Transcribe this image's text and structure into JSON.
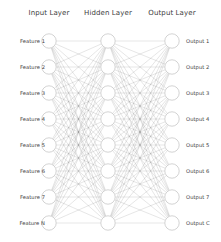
{
  "diagram": {
    "title_semantic": "neural-network-architecture-diagram",
    "background_color": "#ffffff",
    "node_fill_color": "#ffffff",
    "node_stroke_color": "#c8c8c8",
    "edge_color": "#5a5a5a",
    "text_color": "#3c3c3c",
    "layers": [
      {
        "id": "input",
        "title": "Input Layer",
        "center_x": 49,
        "node_count": 8,
        "label_side": "left",
        "nodes": [
          {
            "label": "Feature 1",
            "cy": 41
          },
          {
            "label": "Feature 2",
            "cy": 67
          },
          {
            "label": "Feature 3",
            "cy": 93
          },
          {
            "label": "Feature 4",
            "cy": 119
          },
          {
            "label": "Feature 5",
            "cy": 145
          },
          {
            "label": "Feature 6",
            "cy": 171
          },
          {
            "label": "Feature 7",
            "cy": 197
          },
          {
            "label": "Feature N",
            "cy": 223
          }
        ]
      },
      {
        "id": "hidden",
        "title": "Hidden Layer",
        "center_x": 108,
        "node_count": 8,
        "label_side": "none",
        "nodes": [
          {
            "label": "",
            "cy": 41
          },
          {
            "label": "",
            "cy": 67
          },
          {
            "label": "",
            "cy": 93
          },
          {
            "label": "",
            "cy": 119
          },
          {
            "label": "",
            "cy": 145
          },
          {
            "label": "",
            "cy": 171
          },
          {
            "label": "",
            "cy": 197
          },
          {
            "label": "",
            "cy": 223
          }
        ]
      },
      {
        "id": "output",
        "title": "Output Layer",
        "center_x": 172,
        "node_count": 8,
        "label_side": "right",
        "nodes": [
          {
            "label": "Output 1",
            "cy": 41
          },
          {
            "label": "Output 2",
            "cy": 67
          },
          {
            "label": "Output 3",
            "cy": 93
          },
          {
            "label": "Output 4",
            "cy": 119
          },
          {
            "label": "Output 5",
            "cy": 145
          },
          {
            "label": "Output 6",
            "cy": 171
          },
          {
            "label": "Output 7",
            "cy": 197
          },
          {
            "label": "Output C",
            "cy": 223
          }
        ]
      }
    ],
    "node_radius": 7.2,
    "edge_opacity": 0.45,
    "edge_width": 0.35,
    "connections": [
      {
        "from": "input",
        "to": "hidden",
        "type": "fully-connected"
      },
      {
        "from": "hidden",
        "to": "output",
        "type": "fully-connected"
      }
    ]
  }
}
